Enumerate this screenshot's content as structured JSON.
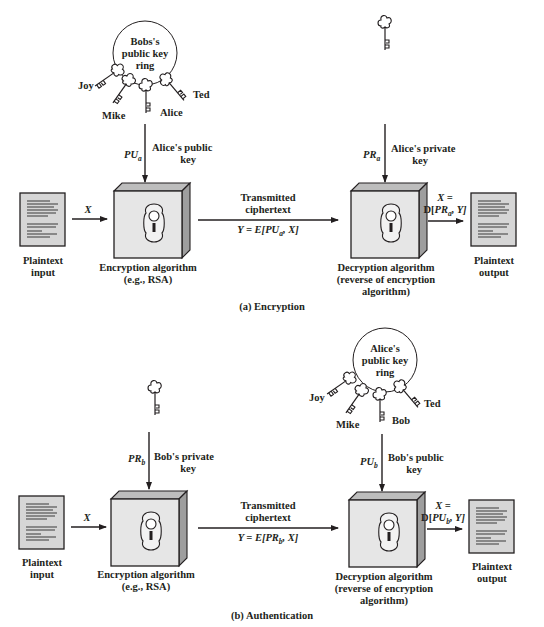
{
  "figure": {
    "panels": [
      {
        "id": "a",
        "caption": "(a) Encryption",
        "key_ring": {
          "title_lines": [
            "Bobs's",
            "public key",
            "ring"
          ],
          "keys": [
            "Joy",
            "Mike",
            "Alice",
            "Ted"
          ]
        },
        "sender_key": {
          "symbol": "PU",
          "subscript": "a",
          "label_lines": [
            "Alice's public",
            "key"
          ]
        },
        "receiver_key": {
          "symbol": "PR",
          "subscript": "a",
          "label_lines": [
            "Alice's private",
            "key"
          ]
        },
        "input": {
          "label_lines": [
            "Plaintext",
            "input"
          ],
          "arrow_label": "X"
        },
        "encryption": {
          "label_lines": [
            "Encryption algorithm",
            "(e.g., RSA)"
          ]
        },
        "channel": {
          "label_lines": [
            "Transmitted",
            "ciphertext"
          ],
          "formula_prefix": "Y = E[",
          "formula_symbol": "PU",
          "formula_sub": "a",
          "formula_suffix": ", X]"
        },
        "decryption": {
          "label_lines": [
            "Decryption algorithm",
            "(reverse of encryption",
            "algorithm)"
          ]
        },
        "output_formula": {
          "line1": "X =",
          "prefix": "D[",
          "symbol": "PR",
          "sub": "a",
          "suffix": ", Y]"
        },
        "output": {
          "label_lines": [
            "Plaintext",
            "output"
          ]
        }
      },
      {
        "id": "b",
        "caption": "(b) Authentication",
        "key_ring": {
          "title_lines": [
            "Alice's",
            "public key",
            "ring"
          ],
          "keys": [
            "Joy",
            "Mike",
            "Bob",
            "Ted"
          ]
        },
        "sender_key": {
          "symbol": "PR",
          "subscript": "b",
          "label_lines": [
            "Bob's private",
            "key"
          ]
        },
        "receiver_key": {
          "symbol": "PU",
          "subscript": "b",
          "label_lines": [
            "Bob's public",
            "key"
          ]
        },
        "input": {
          "label_lines": [
            "Plaintext",
            "input"
          ],
          "arrow_label": "X"
        },
        "encryption": {
          "label_lines": [
            "Encryption algorithm",
            "(e.g., RSA)"
          ]
        },
        "channel": {
          "label_lines": [
            "Transmitted",
            "ciphertext"
          ],
          "formula_prefix": "Y = E[",
          "formula_symbol": "PR",
          "formula_sub": "b",
          "formula_suffix": ", X]"
        },
        "decryption": {
          "label_lines": [
            "Decryption algorithm",
            "(reverse of encryption",
            "algorithm)"
          ]
        },
        "output_formula": {
          "line1": "X =",
          "prefix": "D[",
          "symbol": "PU",
          "sub": "b",
          "suffix": ", Y]"
        },
        "output": {
          "label_lines": [
            "Plaintext",
            "output"
          ]
        }
      }
    ]
  },
  "colors": {
    "ink": "#231f20",
    "box_front": "#e6e6e6",
    "box_top": "#bdbdbd",
    "box_side": "#9e9e9e",
    "doc_fill": "#d6d6d6"
  }
}
